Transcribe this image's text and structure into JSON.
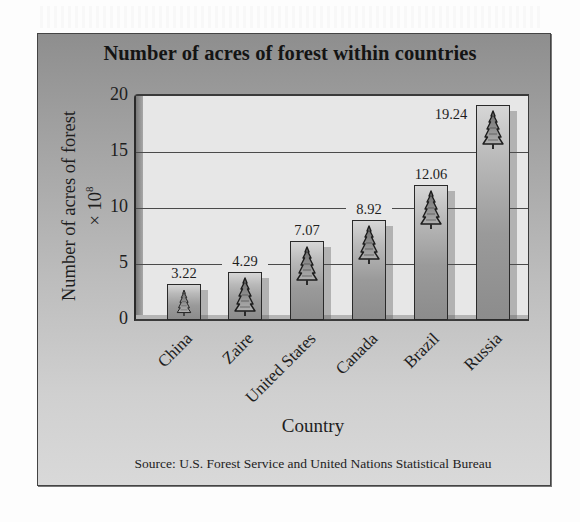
{
  "chart_data": {
    "type": "bar",
    "title": "Number of acres of forest within countries",
    "xlabel": "Country",
    "ylabel": "Number of acres of forest × 10^8",
    "ylabel_line1": "Number of acres of forest",
    "ylabel_line2_prefix": "× 10",
    "ylabel_line2_exp": "8",
    "categories": [
      "China",
      "Zaire",
      "United States",
      "Canada",
      "Brazil",
      "Russia"
    ],
    "values": [
      3.22,
      4.29,
      7.07,
      8.92,
      12.06,
      19.24
    ],
    "value_labels": [
      "3.22",
      "4.29",
      "7.07",
      "8.92",
      "12.06",
      "19.24"
    ],
    "yticks": [
      "0",
      "5",
      "10",
      "15",
      "20"
    ],
    "ylim": [
      0,
      20
    ],
    "grid": true,
    "legend": null,
    "bar_icon": "fir-tree-icon",
    "source": "Source: U.S. Forest Service and United Nations Statistical Bureau"
  },
  "colors": {
    "frame_top": "#8e8e8e",
    "frame_bottom": "#d9d9d9",
    "plot_bg": "#e7e7e7",
    "bar_top": "#d6d6d6",
    "bar_bottom": "#8c8c8c",
    "grid": "#4a4a4a"
  }
}
